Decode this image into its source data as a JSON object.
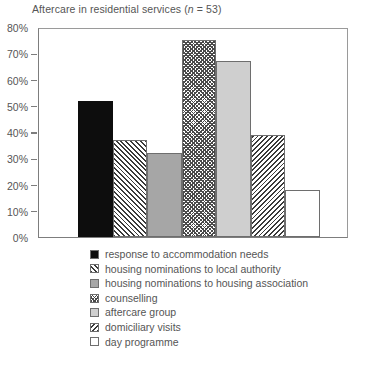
{
  "chart_data": {
    "type": "bar",
    "title": "Aftercare in residential services (n = 53)",
    "title_prefix": "Aftercare in residential services (",
    "title_italic": "n",
    "title_suffix": " = 53)",
    "xlabel": "",
    "ylabel": "",
    "ylim": [
      0,
      80
    ],
    "ytick_labels": [
      "80%",
      "70%",
      "60%",
      "50%",
      "40%",
      "30%",
      "20%",
      "10%",
      "0%"
    ],
    "ytick_values": [
      80,
      70,
      60,
      50,
      40,
      30,
      20,
      10,
      0
    ],
    "grid": false,
    "legend_position": "below-left",
    "categories": [
      "response to accommodation needs",
      "housing nominations to local authority",
      "housing nominations to housing association",
      "counselling",
      "aftercare group",
      "domiciliary visits",
      "day programme"
    ],
    "values": [
      52,
      37,
      32,
      75,
      67,
      39,
      18
    ],
    "patterns": [
      "solid-black",
      "diagonal-forward-hatch",
      "solid-gray-mid",
      "checkerboard",
      "solid-gray-light",
      "diagonal-backward-hatch",
      "solid-white"
    ],
    "colors": {
      "solid-black": "#0d0d0d",
      "solid-gray-mid": "#a6a6a6",
      "solid-gray-light": "#cfcfcf",
      "solid-white": "#ffffff",
      "hatch-line": "#3a3a3a",
      "bar-outline": "#6e6e6e",
      "axis": "#7d7d7d",
      "text": "#555555"
    }
  },
  "legend": {
    "items": [
      {
        "label": "response to accommodation needs",
        "pattern": "solid-black"
      },
      {
        "label": "housing nominations to local authority",
        "pattern": "diagonal-forward-hatch"
      },
      {
        "label": "housing nominations to housing association",
        "pattern": "solid-gray-mid"
      },
      {
        "label": "counselling",
        "pattern": "checkerboard"
      },
      {
        "label": "aftercare group",
        "pattern": "solid-gray-light"
      },
      {
        "label": "domiciliary visits",
        "pattern": "diagonal-backward-hatch"
      },
      {
        "label": "day programme",
        "pattern": "solid-white"
      }
    ]
  }
}
